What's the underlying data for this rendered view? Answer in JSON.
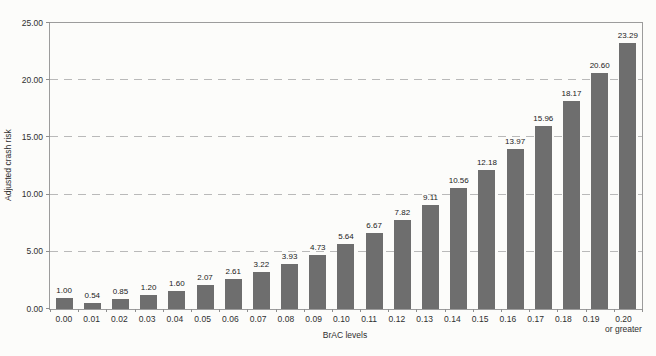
{
  "chart_data": {
    "type": "bar",
    "xlabel": "BrAC levels",
    "ylabel": "Adjusted crash risk",
    "categories": [
      "0.00",
      "0.01",
      "0.02",
      "0.03",
      "0.04",
      "0.05",
      "0.06",
      "0.07",
      "0.08",
      "0.09",
      "0.10",
      "0.11",
      "0.12",
      "0.13",
      "0.14",
      "0.15",
      "0.16",
      "0.17",
      "0.18",
      "0.19",
      "0.20"
    ],
    "last_category_note": "or greater",
    "values": [
      1.0,
      0.54,
      0.85,
      1.2,
      1.6,
      2.07,
      2.61,
      3.22,
      3.93,
      4.73,
      5.64,
      6.67,
      7.82,
      9.11,
      10.56,
      12.18,
      13.97,
      15.96,
      18.17,
      20.6,
      23.29
    ],
    "value_labels": [
      "1.00",
      "0.54",
      "0.85",
      "1.20",
      "1.60",
      "2.07",
      "2.61",
      "3.22",
      "3.93",
      "4.73",
      "5.64",
      "6.67",
      "7.82",
      "9.11",
      "10.56",
      "12.18",
      "13.97",
      "15.96",
      "18.17",
      "20.60",
      "23.29"
    ],
    "ylim": [
      0,
      25
    ],
    "yticks": [
      "0.00",
      "5.00",
      "10.00",
      "15.00",
      "20.00",
      "25.00"
    ],
    "gridlines": [
      5,
      10,
      15,
      20
    ],
    "grid_style": "dashed-horizontal",
    "legend": "none",
    "colors": {
      "bar": "#6e6e6e",
      "axis": "#9c9c9c",
      "grid": "#b9b9b9",
      "text": "#2f2f2f",
      "background": "#fcfcfa"
    }
  }
}
